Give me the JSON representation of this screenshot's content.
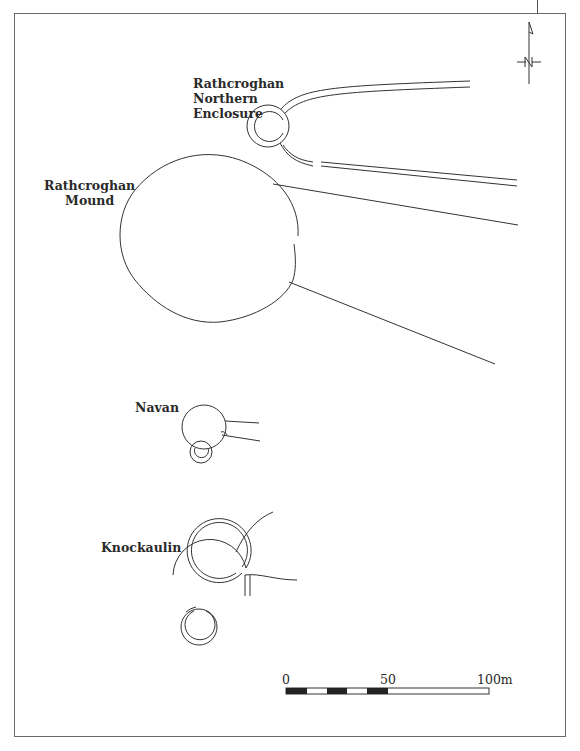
{
  "figure": {
    "north_arrow_label": "N",
    "sites": [
      {
        "id": "rathcroghan-northern-enclosure",
        "label_lines": [
          "Rathcroghan",
          "Northern",
          "Enclosure"
        ]
      },
      {
        "id": "rathcroghan-mound",
        "label_lines": [
          "Rathcroghan",
          "Mound"
        ]
      },
      {
        "id": "navan",
        "label_lines": [
          "Navan"
        ]
      },
      {
        "id": "knockaulin",
        "label_lines": [
          "Knockaulin"
        ]
      }
    ],
    "scale_bar": {
      "labels": [
        "0",
        "50",
        "100m"
      ],
      "unit": "m",
      "max": 100
    },
    "colors": {
      "line": "#333333",
      "frame": "#6a6a6a",
      "background": "#ffffff"
    }
  }
}
